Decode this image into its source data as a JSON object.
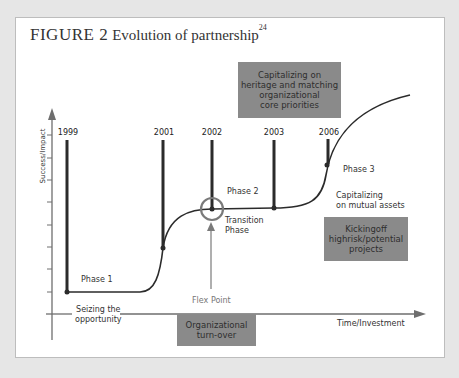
{
  "figure": {
    "label": "FIGURE 2",
    "title": "Evolution of partnership",
    "footnote": "24"
  },
  "axes": {
    "y_label": "Success/Impact",
    "x_label": "Time/Investment"
  },
  "years": [
    "1999",
    "2001",
    "2002",
    "2003",
    "2006"
  ],
  "phases": {
    "phase1": "Phase 1",
    "phase2": "Phase 2",
    "phase3": "Phase 3",
    "transition_line1": "Transition",
    "transition_line2": "Phase",
    "flex_point": "Flex Point"
  },
  "annotations": {
    "seizing_line1": "Seizing the",
    "seizing_line2": "opportunity",
    "capitalizing_mutual_line1": "Capitalizing",
    "capitalizing_mutual_line2": "on mutual assets"
  },
  "boxes": {
    "heritage": [
      "Capitalizing on",
      "heritage and matching",
      "organizational",
      "core priorities"
    ],
    "kickingoff": [
      "Kickingoff",
      "highrisk/potential",
      "projects"
    ],
    "turnover": [
      "Organizational",
      "turn-over"
    ]
  },
  "colors": {
    "box_fill": "#8a8a8a",
    "line": "#2b2b2b",
    "axis": "#6e6e6e",
    "background": "#e6e6e6"
  }
}
